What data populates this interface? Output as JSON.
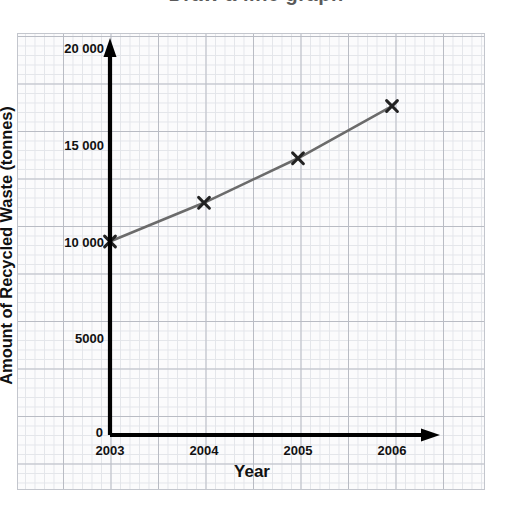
{
  "header": {
    "cropped_title": "Draw a line graph"
  },
  "chart": {
    "y_axis_title": "Amount of Recycled Waste (tonnes)",
    "x_axis_title": "Year",
    "origin_label": "0"
  },
  "chart_data": {
    "type": "line",
    "title": "",
    "xlabel": "Year",
    "ylabel": "Amount of Recycled Waste (tonnes)",
    "x": [
      2003,
      2004,
      2005,
      2006
    ],
    "xtick_labels": [
      "2003",
      "2004",
      "2005",
      "2006"
    ],
    "values": [
      10000,
      12000,
      14300,
      17000
    ],
    "ytick_values": [
      0,
      5000,
      10000,
      15000,
      20000
    ],
    "ytick_labels": [
      "0",
      "5000",
      "10 000",
      "15 000",
      "20 000"
    ],
    "ylim": [
      0,
      20000
    ],
    "xlim": [
      2003,
      2006
    ],
    "grid": true,
    "legend": false,
    "marker": "x",
    "line_color": "#6b6b6b",
    "marker_color": "#222222",
    "axis_color": "#000000",
    "grid_major_color": "#b9bcc4",
    "grid_minor_color": "#e3e5ea",
    "series": [
      {
        "name": "Recycled Waste",
        "values": [
          10000,
          12000,
          14300,
          17000
        ]
      }
    ]
  }
}
